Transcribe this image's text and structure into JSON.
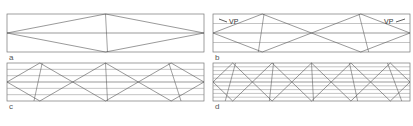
{
  "figure": {
    "panels": [
      {
        "id": "a",
        "label": "a",
        "x": 7,
        "y": 14,
        "w": 197,
        "h": 38,
        "divisions": 1
      },
      {
        "id": "b",
        "label": "b",
        "x": 213,
        "y": 14,
        "w": 197,
        "h": 38,
        "divisions": 2
      },
      {
        "id": "c",
        "label": "c",
        "x": 7,
        "y": 63,
        "w": 197,
        "h": 38,
        "divisions": 3
      },
      {
        "id": "d",
        "label": "d",
        "x": 213,
        "y": 63,
        "w": 197,
        "h": 38,
        "divisions": 5
      }
    ],
    "annotations": {
      "vp_left": "VP",
      "vp_right": "VP"
    },
    "colors": {
      "line": "#555555",
      "frame": "#777777",
      "label": "#555555"
    }
  }
}
